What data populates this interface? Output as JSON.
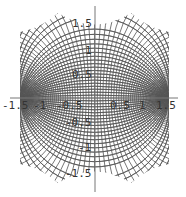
{
  "chart_data": {
    "type": "line",
    "title": "",
    "xlabel": "",
    "ylabel": "",
    "xlim": [
      -1.5,
      1.5
    ],
    "ylim": [
      -1.5,
      1.5
    ],
    "grid": false,
    "foci": [
      [
        -1.5,
        0
      ],
      [
        1.5,
        0
      ]
    ],
    "x_ticks": [
      "-1.5",
      "-1",
      "-0.5",
      "0.5",
      "1",
      "1.5"
    ],
    "y_ticks": [
      "1.5",
      "1",
      "0.5",
      "-0.5",
      "-1",
      "-1.5"
    ],
    "line_color": "#555555",
    "axis_color": "#777777"
  },
  "axes": {
    "x_tick_labels": [
      "-1.5",
      "-1",
      "-0.5",
      "0.5",
      "1",
      "1.5"
    ],
    "y_tick_labels": [
      "1.5",
      "1",
      "0.5",
      "-0.5",
      "-1",
      "-1.5"
    ]
  }
}
